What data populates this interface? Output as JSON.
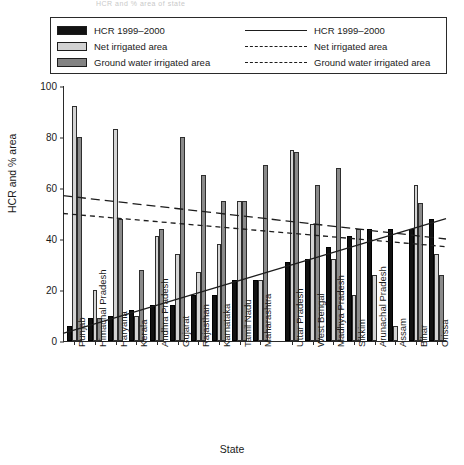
{
  "figure": {
    "faint_header": "HCR and % area of state",
    "xlabel": "State",
    "ylabel": "HCR and % area"
  },
  "legend": {
    "bar_entries": [
      {
        "label": "HCR 1999–2000",
        "swatch": "black"
      },
      {
        "label": "Net irrigated area",
        "swatch": "light"
      },
      {
        "label": "Ground water irrigated area",
        "swatch": "dark"
      }
    ],
    "line_entries": [
      {
        "label": "HCR 1999–2000",
        "style": "solid"
      },
      {
        "label": "Net irrigated area",
        "style": "dashed-long"
      },
      {
        "label": "Ground water irrigated area",
        "style": "dashed-short"
      }
    ]
  },
  "colors": {
    "hcr_bar": "#111111",
    "net_irrigated_bar": "#d4d4d4",
    "ground_water_bar": "#8a8a8a",
    "axis": "#2a2a2a",
    "trend_line": "#1d1d1d"
  },
  "chart_data": {
    "type": "bar",
    "title": "",
    "xlabel": "State",
    "ylabel": "HCR and % area",
    "ylim": [
      0,
      100
    ],
    "yticks": [
      0,
      20,
      40,
      60,
      80,
      100
    ],
    "grid": false,
    "legend_position": "top",
    "categories": [
      "Punjab",
      "Himachal Pradesh",
      "Haryana",
      "Kerala",
      "Andhra Pradesh",
      "Gujarat",
      "Rajasthan",
      "Karnataka",
      "Tamil Nadu",
      "Maharashtra",
      "Uttar Pradesh",
      "West Bengal",
      "Madhya Pradesh",
      "Sikkim",
      "Arunachal Pradesh",
      "Assam",
      "Bihar",
      "Orissa"
    ],
    "series": [
      {
        "name": "HCR 1999–2000",
        "values": [
          6,
          9,
          10,
          12,
          14,
          14,
          18,
          18,
          24,
          24,
          31,
          32,
          37,
          41,
          44,
          44,
          44,
          48
        ]
      },
      {
        "name": "Net irrigated area",
        "values": [
          92,
          20,
          83,
          10,
          41,
          34,
          27,
          38,
          55,
          24,
          75,
          46,
          32,
          18,
          26,
          6,
          61,
          34
        ]
      },
      {
        "name": "Ground water irrigated area",
        "values": [
          80,
          9,
          48,
          28,
          44,
          80,
          65,
          55,
          55,
          69,
          74,
          61,
          68,
          44,
          0,
          0,
          54,
          26
        ]
      }
    ],
    "trend_lines": [
      {
        "name": "HCR 1999–2000",
        "style": "solid",
        "y_start": 3,
        "y_end": 48
      },
      {
        "name": "Net irrigated area",
        "style": "dashed-long",
        "y_start": 57,
        "y_end": 40
      },
      {
        "name": "Ground water irrigated area",
        "style": "dashed-short",
        "y_start": 50,
        "y_end": 37
      }
    ]
  }
}
